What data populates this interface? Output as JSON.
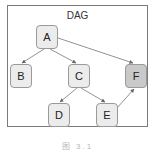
{
  "diagram": {
    "title": "DAG",
    "caption": "图 3.1",
    "nodes": [
      {
        "id": "A",
        "label": "A",
        "x": 36,
        "y": 25,
        "fill": "#ececec"
      },
      {
        "id": "B",
        "label": "B",
        "x": 10,
        "y": 64,
        "fill": "#ececec"
      },
      {
        "id": "C",
        "label": "C",
        "x": 68,
        "y": 64,
        "fill": "#ececec"
      },
      {
        "id": "F",
        "label": "F",
        "x": 125,
        "y": 64,
        "fill": "#c9c9c9"
      },
      {
        "id": "D",
        "label": "D",
        "x": 48,
        "y": 103,
        "fill": "#ececec"
      },
      {
        "id": "E",
        "label": "E",
        "x": 96,
        "y": 103,
        "fill": "#ececec"
      }
    ],
    "edges": [
      {
        "from": "A",
        "to": "B"
      },
      {
        "from": "A",
        "to": "C"
      },
      {
        "from": "A",
        "to": "F"
      },
      {
        "from": "C",
        "to": "D"
      },
      {
        "from": "C",
        "to": "E"
      },
      {
        "from": "E",
        "to": "F"
      }
    ],
    "colors": {
      "frame": "#7a7a7a",
      "node_fill": "#ececec",
      "node_highlight": "#c9c9c9",
      "edge": "#666666"
    }
  }
}
